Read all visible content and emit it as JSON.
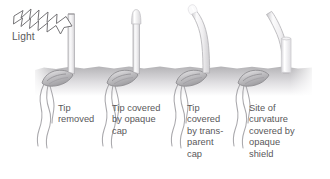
{
  "figure": {
    "width": 330,
    "height": 179,
    "background_color": "#ffffff"
  },
  "light": {
    "label": "Light",
    "arrow_icon": "lightning-arrow-icon",
    "direction": "left-to-right",
    "text_color": "#5b5a5c",
    "outline_color": "#6e6d70"
  },
  "soil": {
    "name": "soil-band",
    "top_color": "#b9b8ba",
    "bottom_color": "#ffffff",
    "left": 35,
    "right": 312,
    "surface_y": 68
  },
  "colors": {
    "stem_outline": "#a9a8ab",
    "stem_fill": "#f4f4f5",
    "stem_shade": "#d8d7da",
    "seed_outline": "#8d8c90",
    "seed_fill": "#c9c8cb",
    "root_stroke": "#a3a2a6",
    "cap_opaque": "#dcdbde",
    "cap_transparent": "#eeeef0",
    "shield_opaque": "#e2e1e4",
    "text": "#59585a"
  },
  "specimens": [
    {
      "id": 1,
      "name": "seedling-tip-removed",
      "label": "Tip\nremoved",
      "stem_shape": "straight-vertical",
      "tip_state": "cut-flat",
      "cap": "none",
      "shield": "none",
      "bends_toward_light": false
    },
    {
      "id": 2,
      "name": "seedling-opaque-cap",
      "label": "Tip covered\nby opaque\ncap",
      "stem_shape": "straight-vertical",
      "tip_state": "capped",
      "cap": "opaque",
      "shield": "none",
      "bends_toward_light": false
    },
    {
      "id": 3,
      "name": "seedling-transparent-cap",
      "label": "Tip\ncovered\nby trans-\nparent\ncap",
      "stem_shape": "curved-toward-light",
      "tip_state": "capped",
      "cap": "transparent",
      "shield": "none",
      "bends_toward_light": true
    },
    {
      "id": 4,
      "name": "seedling-opaque-shield-at-base",
      "label": "Site of\ncurvature\ncovered by\nopaque\nshield",
      "stem_shape": "curved-toward-light",
      "tip_state": "exposed",
      "cap": "none",
      "shield": "opaque-basal-shield",
      "bends_toward_light": true
    }
  ]
}
